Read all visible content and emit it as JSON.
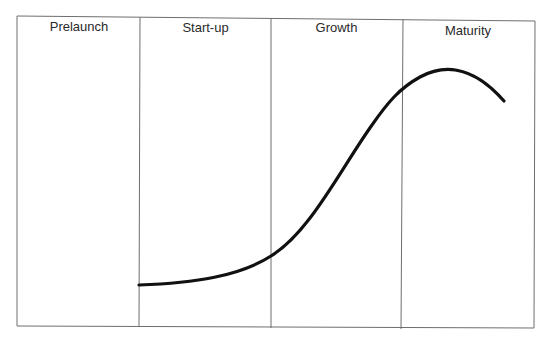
{
  "diagram": {
    "type": "lifecycle-stages",
    "stages": [
      {
        "label": "Prelaunch"
      },
      {
        "label": "Start-up"
      },
      {
        "label": "Growth"
      },
      {
        "label": "Maturity"
      }
    ],
    "curve": {
      "description": "S-shaped lifecycle curve starting flat at the start of Start-up, rising steeply through Growth, peaking early in Maturity and declining slightly",
      "color": "#111111"
    },
    "colors": {
      "frame": "#6e6e6e",
      "text": "#2a2a2a",
      "background": "#ffffff"
    }
  }
}
